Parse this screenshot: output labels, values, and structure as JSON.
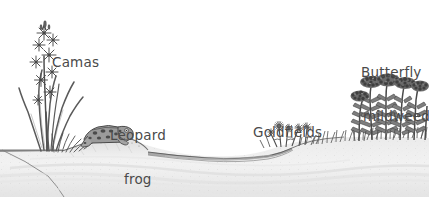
{
  "illustration": {
    "title": "Vernal pool habitat cross-section",
    "style": "grayscale pen-and-ink line drawing",
    "background_color": "#ffffff",
    "ink_color": "#4a4a4a",
    "ground_fill": "#f0f0f0",
    "water_fill": "#8d8d8d",
    "width": 429,
    "height": 197
  },
  "labels": {
    "camas": {
      "text": "Camas",
      "lines": [
        "Camas"
      ]
    },
    "leopard_frog": {
      "text": "Leopard frog",
      "lines": [
        "Leopard",
        "frog"
      ]
    },
    "goldfields": {
      "text": "Goldfields",
      "lines": [
        "Goldfields"
      ]
    },
    "butterfly_milkweed": {
      "text": "Butterfly mildweed",
      "lines": [
        "Butterfly",
        "mildweed"
      ]
    }
  },
  "elements": [
    {
      "name": "camas-plant",
      "kind": "plant",
      "label": "Camas"
    },
    {
      "name": "leopard-frog",
      "kind": "animal",
      "label": "Leopard frog"
    },
    {
      "name": "goldfields-plant",
      "kind": "plant",
      "label": "Goldfields"
    },
    {
      "name": "butterfly-milkweed-plant",
      "kind": "plant",
      "label": "Butterfly mildweed"
    },
    {
      "name": "pond-water",
      "kind": "terrain",
      "label": ""
    },
    {
      "name": "ground-bank",
      "kind": "terrain",
      "label": ""
    }
  ]
}
